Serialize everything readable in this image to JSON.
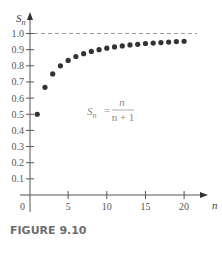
{
  "chart_data": {
    "type": "scatter",
    "title": "",
    "xlabel": "n",
    "ylabel": "S_n",
    "xlim": [
      0,
      21.5
    ],
    "ylim": [
      0,
      1.1
    ],
    "grid": false,
    "x_ticks": [
      0,
      5,
      10,
      15,
      20
    ],
    "x_tick_labels": [
      "0",
      "5",
      "10",
      "15",
      "20"
    ],
    "y_ticks": [
      0.1,
      0.2,
      0.3,
      0.4,
      0.5,
      0.6,
      0.7,
      0.8,
      0.9,
      1.0
    ],
    "y_tick_labels": [
      "0.1",
      "0.2",
      "0.3",
      "0.4",
      "0.5",
      "0.6",
      "0.7",
      "0.8",
      "0.9",
      "1.0"
    ],
    "series": [
      {
        "name": "S_n = n/(n+1)",
        "x": [
          1,
          2,
          3,
          4,
          5,
          6,
          7,
          8,
          9,
          10,
          11,
          12,
          13,
          14,
          15,
          16,
          17,
          18,
          19,
          20
        ],
        "values": [
          0.5,
          0.667,
          0.75,
          0.8,
          0.833,
          0.857,
          0.875,
          0.889,
          0.9,
          0.909,
          0.917,
          0.923,
          0.929,
          0.933,
          0.938,
          0.941,
          0.944,
          0.947,
          0.95,
          0.952
        ]
      }
    ],
    "reference_lines": [
      {
        "type": "horizontal",
        "y": 1.0,
        "style": "dashed"
      }
    ],
    "annotations": [
      {
        "text": "S_n = n / (n + 1)",
        "position": "center-right"
      }
    ]
  },
  "axes": {
    "x_label": "n",
    "y_label_main": "S",
    "y_label_sub": "n",
    "origin_label": "0"
  },
  "formula": {
    "lhs_main": "S",
    "lhs_sub": "n",
    "equals": "=",
    "numerator": "n",
    "denominator": "n + 1"
  },
  "caption": "FIGURE 9.10"
}
